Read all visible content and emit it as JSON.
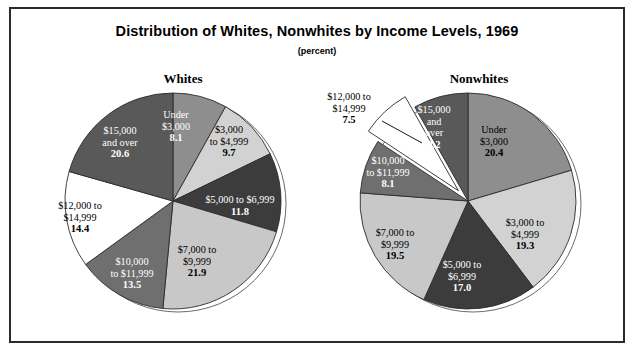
{
  "chart_title": "Distribution of Whites, Nonwhites by Income Levels, 1969",
  "chart_subtitle": "(percent)",
  "panels": {
    "whites_heading": "Whites",
    "nonwhites_heading": "Nonwhites"
  },
  "chart_data": {
    "type": "pie",
    "title": "Distribution of Whites, Nonwhites by Income Levels, 1969",
    "subtitle": "(percent)",
    "unit": "percent",
    "legend": "none",
    "grid": false,
    "charts": [
      {
        "name": "Whites",
        "center": [
          173,
          201
        ],
        "radius": 108,
        "start_angle_deg": 0,
        "direction": "clockwise",
        "categories": [
          "Under $3,000",
          "$3,000 to $4,999",
          "$5,000 to $6,999",
          "$7,000 to $9,999",
          "$10,000 to $11,999",
          "$12,000 to $14,999",
          "$15,000 and over"
        ],
        "values": [
          8.1,
          9.7,
          11.8,
          21.9,
          13.5,
          14.4,
          20.6
        ],
        "colors": [
          "#8e8e8e",
          "#d2d2d2",
          "#3c3c3c",
          "#c8c8c8",
          "#6f6f6f",
          "#ffffff",
          "#595959"
        ],
        "label_colors": [
          "#ffffff",
          "#000000",
          "#ffffff",
          "#000000",
          "#ffffff",
          "#000000",
          "#ffffff"
        ],
        "slices": [
          {
            "label_lines": [
              "Under",
              "$3,000"
            ],
            "value": "8.1",
            "exploded": false,
            "label_pos": "inside",
            "lx": 176,
            "ly": 118
          },
          {
            "label_lines": [
              "$3,000",
              "to $4,999"
            ],
            "value": "9.7",
            "exploded": false,
            "label_pos": "inside",
            "lx": 229,
            "ly": 133
          },
          {
            "label_lines": [
              "$5,000 to $6,999"
            ],
            "value": "11.8",
            "exploded": false,
            "label_pos": "inside",
            "lx": 240,
            "ly": 203
          },
          {
            "label_lines": [
              "$7,000 to",
              "$9,999"
            ],
            "value": "21.9",
            "exploded": false,
            "label_pos": "inside",
            "lx": 197,
            "ly": 253
          },
          {
            "label_lines": [
              "$10,000",
              "to $11,999"
            ],
            "value": "13.5",
            "exploded": false,
            "label_pos": "inside",
            "lx": 132,
            "ly": 265
          },
          {
            "label_lines": [
              "$12,000 to",
              "$14,999"
            ],
            "value": "14.4",
            "exploded": false,
            "label_pos": "inside",
            "lx": 80,
            "ly": 209
          },
          {
            "label_lines": [
              "$15,000",
              "and over"
            ],
            "value": "20.6",
            "exploded": false,
            "label_pos": "inside",
            "lx": 120,
            "ly": 134
          }
        ]
      },
      {
        "name": "Nonwhites",
        "center": [
          468,
          201
        ],
        "radius": 108,
        "start_angle_deg": 0,
        "direction": "clockwise",
        "categories": [
          "Under $3,000",
          "$3,000 to $4,999",
          "$5,000 to $6,999",
          "$7,000 to $9,999",
          "$10,000 to $11,999",
          "$12,000 to $14,999",
          "$15,000 and over"
        ],
        "values": [
          20.4,
          19.3,
          17.0,
          19.5,
          8.1,
          7.5,
          8.2
        ],
        "colors": [
          "#8e8e8e",
          "#d2d2d2",
          "#3c3c3c",
          "#c8c8c8",
          "#6f6f6f",
          "#ffffff",
          "#595959"
        ],
        "label_colors": [
          "#000000",
          "#000000",
          "#ffffff",
          "#000000",
          "#ffffff",
          "#000000",
          "#ffffff"
        ],
        "slices": [
          {
            "label_lines": [
              "Under",
              "$3,000"
            ],
            "value": "20.4",
            "exploded": false,
            "label_pos": "inside",
            "lx": 494,
            "ly": 133
          },
          {
            "label_lines": [
              "$3,000 to",
              "$4,999"
            ],
            "value": "19.3",
            "exploded": false,
            "label_pos": "inside",
            "lx": 525,
            "ly": 226
          },
          {
            "label_lines": [
              "$5,000 to",
              "$6,999"
            ],
            "value": "17.0",
            "exploded": false,
            "label_pos": "inside",
            "lx": 462,
            "ly": 268
          },
          {
            "label_lines": [
              "$7,000 to",
              "$9,999"
            ],
            "value": "19.5",
            "exploded": false,
            "label_pos": "inside",
            "lx": 395,
            "ly": 236
          },
          {
            "label_lines": [
              "$10,000",
              "to $11,999"
            ],
            "value": "8.1",
            "exploded": false,
            "label_pos": "inside",
            "lx": 388,
            "ly": 164
          },
          {
            "label_lines": [
              "$12,000 to",
              "$14,999"
            ],
            "value": "7.5",
            "exploded": true,
            "label_pos": "outside",
            "lx": 349,
            "ly": 100,
            "leader": [
              382,
              121,
              422,
              143
            ]
          },
          {
            "label_lines": [
              "$15,000",
              "and",
              "over"
            ],
            "value": "8.2",
            "exploded": false,
            "label_pos": "inside",
            "lx": 434,
            "ly": 113
          }
        ]
      }
    ]
  }
}
